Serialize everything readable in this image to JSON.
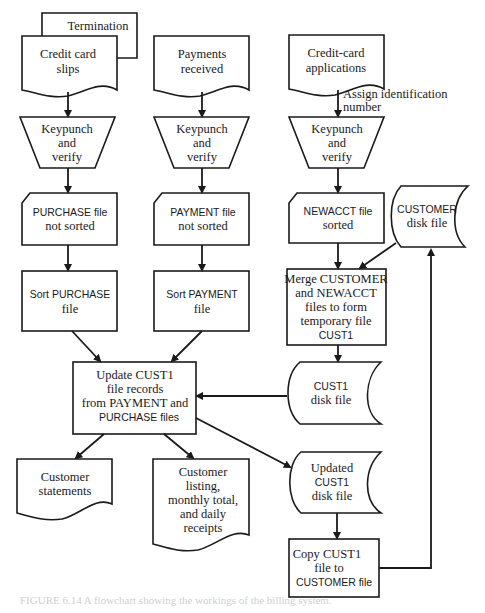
{
  "diagram": {
    "type": "system-flowchart",
    "nodes": {
      "termination": {
        "shape": "document",
        "lines": [
          "Termination"
        ]
      },
      "credit_card_slips": {
        "shape": "document",
        "lines": [
          "Credit card",
          "slips"
        ]
      },
      "payments_received": {
        "shape": "document",
        "lines": [
          "Payments",
          "received"
        ]
      },
      "credit_card_applications": {
        "shape": "document",
        "lines": [
          "Credit-card",
          "applications"
        ]
      },
      "assign_id_note": {
        "shape": "annotation",
        "lines": [
          "Assign identification",
          "number"
        ]
      },
      "keypunch_1": {
        "shape": "manual-operation",
        "lines": [
          "Keypunch",
          "and",
          "verify"
        ]
      },
      "keypunch_2": {
        "shape": "manual-operation",
        "lines": [
          "Keypunch",
          "and",
          "verify"
        ]
      },
      "keypunch_3": {
        "shape": "manual-operation",
        "lines": [
          "Keypunch",
          "and",
          "verify"
        ]
      },
      "purchase_file": {
        "shape": "card",
        "lines": [
          "PURCHASE file",
          "not sorted"
        ]
      },
      "payment_file": {
        "shape": "card",
        "lines": [
          "PAYMENT  file",
          "not sorted"
        ]
      },
      "newacct_file": {
        "shape": "card",
        "lines": [
          "NEWACCT  file",
          "sorted"
        ]
      },
      "customer_disk": {
        "shape": "stored-data",
        "lines": [
          "CUSTOMER",
          "disk file"
        ]
      },
      "sort_purchase": {
        "shape": "process",
        "lines": [
          "Sort PURCHASE",
          "file"
        ]
      },
      "sort_payment": {
        "shape": "process",
        "lines": [
          "Sort PAYMENT",
          "file"
        ]
      },
      "merge": {
        "shape": "process",
        "lines": [
          "Merge CUSTOMER",
          "and NEWACCT",
          "files to form",
          "temporary file",
          "CUST1"
        ]
      },
      "update": {
        "shape": "process",
        "lines": [
          "Update CUST1",
          "file records",
          "from PAYMENT and",
          "PURCHASE files"
        ]
      },
      "cust1_disk": {
        "shape": "stored-data",
        "lines": [
          "CUST1",
          "disk file"
        ]
      },
      "customer_statements": {
        "shape": "document",
        "lines": [
          "Customer",
          "statements"
        ]
      },
      "customer_listing": {
        "shape": "document",
        "lines": [
          "Customer",
          "listing,",
          "monthly total,",
          "and daily",
          "receipts"
        ]
      },
      "updated_cust1": {
        "shape": "stored-data",
        "lines": [
          "Updated",
          "CUST1",
          "disk file"
        ]
      },
      "copy": {
        "shape": "process",
        "lines": [
          "Copy CUST1",
          "file to",
          "CUSTOMER file"
        ]
      }
    },
    "edges": [
      [
        "credit_card_slips",
        "keypunch_1"
      ],
      [
        "payments_received",
        "keypunch_2"
      ],
      [
        "credit_card_applications",
        "keypunch_3"
      ],
      [
        "keypunch_1",
        "purchase_file"
      ],
      [
        "keypunch_2",
        "payment_file"
      ],
      [
        "keypunch_3",
        "newacct_file"
      ],
      [
        "purchase_file",
        "sort_purchase"
      ],
      [
        "payment_file",
        "sort_payment"
      ],
      [
        "newacct_file",
        "merge"
      ],
      [
        "customer_disk",
        "merge"
      ],
      [
        "sort_purchase",
        "update"
      ],
      [
        "sort_payment",
        "update"
      ],
      [
        "merge",
        "cust1_disk"
      ],
      [
        "cust1_disk",
        "update"
      ],
      [
        "update",
        "customer_statements"
      ],
      [
        "update",
        "customer_listing"
      ],
      [
        "update",
        "updated_cust1"
      ],
      [
        "updated_cust1",
        "copy"
      ],
      [
        "copy",
        "customer_disk"
      ]
    ],
    "caption": "FIGURE 6.14  A flowchart showing the workings of the billing system."
  }
}
